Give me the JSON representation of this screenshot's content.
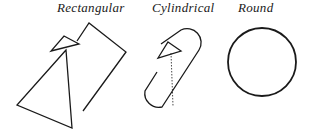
{
  "diagram": {
    "labels": {
      "rectangular": "Rectangular",
      "cylindrical": "Cylindrical",
      "round": "Round"
    },
    "shapes": [
      {
        "name": "rectangular",
        "form": "rotated rectangle with triangular arrow marker"
      },
      {
        "name": "cylindrical",
        "form": "rotated capsule (stadium) with triangular arrow marker and dotted line"
      },
      {
        "name": "round",
        "form": "circle"
      }
    ],
    "colors": {
      "stroke": "#1a1a1a",
      "background": "#ffffff"
    }
  }
}
